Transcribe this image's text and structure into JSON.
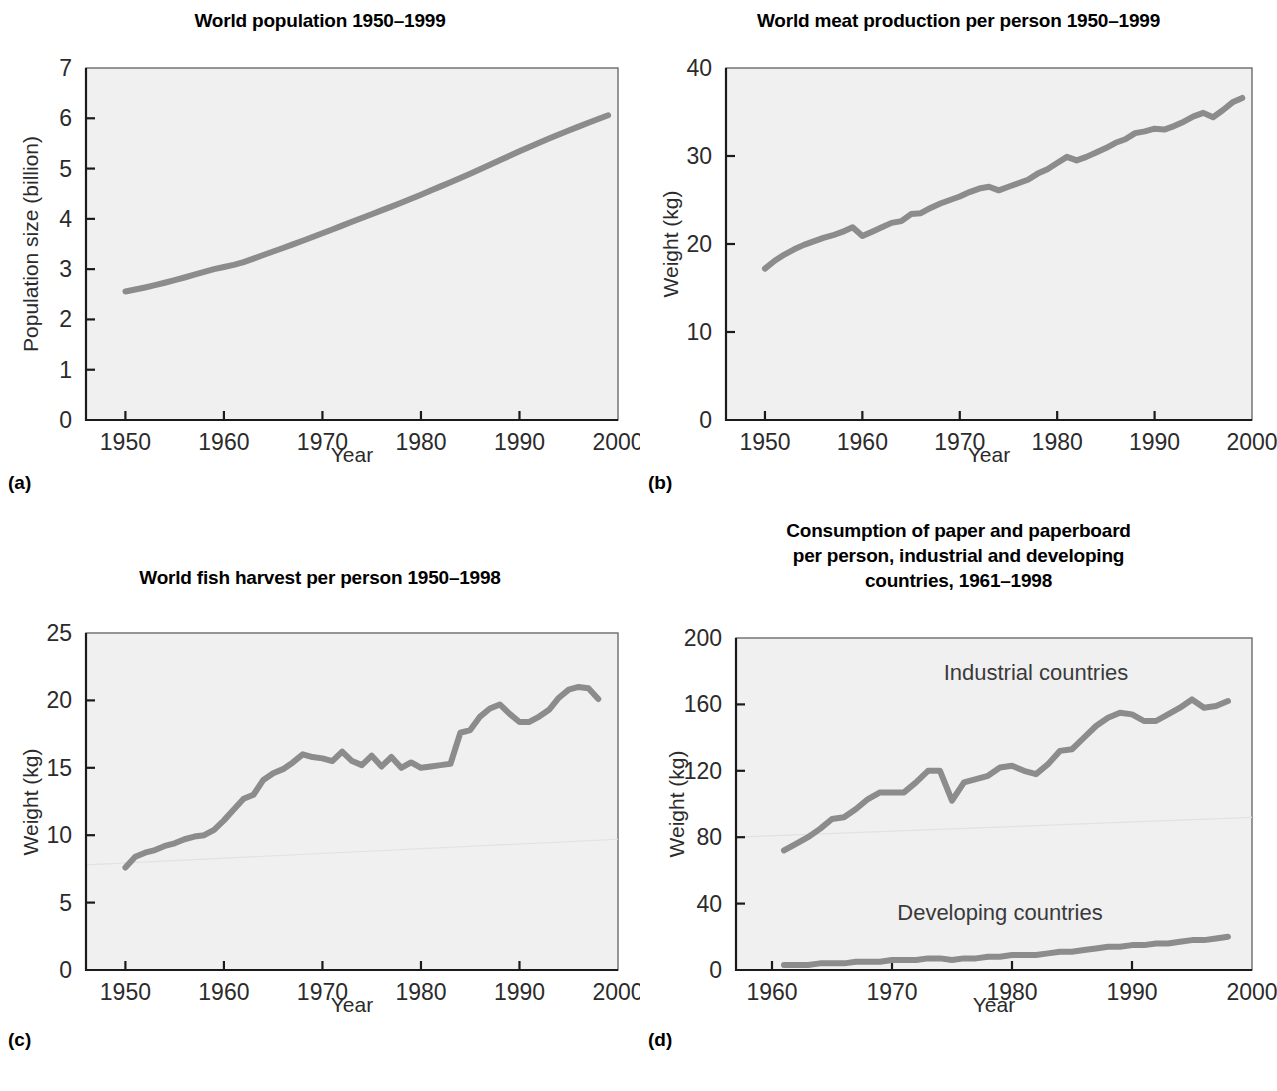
{
  "figure": {
    "background": "#ffffff",
    "line_color": "#8c8c8c",
    "plot_background": "#f0f0f0"
  },
  "panels": [
    {
      "letter": "(a)",
      "title": "World population 1950–1999",
      "xlabel": "Year",
      "ylabel": "Population size (billion)"
    },
    {
      "letter": "(b)",
      "title": "World meat production per person 1950–1999",
      "xlabel": "Year",
      "ylabel": "Weight (kg)"
    },
    {
      "letter": "(c)",
      "title": "World fish harvest per person 1950–1998",
      "xlabel": "Year",
      "ylabel": "Weight (kg)"
    },
    {
      "letter": "(d)",
      "title_lines": [
        "Consumption of paper and paperboard",
        "per person, industrial and developing",
        "countries, 1961–1998"
      ],
      "xlabel": "Year",
      "ylabel": "Weight (kg)",
      "annotations": [
        "Industrial countries",
        "Developing countries"
      ]
    }
  ],
  "chart_data": [
    {
      "id": "a",
      "type": "line",
      "title": "World population 1950–1999",
      "xlabel": "Year",
      "ylabel": "Population size (billion)",
      "xlim": [
        1946,
        2000
      ],
      "ylim": [
        0,
        7
      ],
      "xticks": [
        1950,
        1960,
        1970,
        1980,
        1990,
        2000
      ],
      "yticks": [
        0,
        1,
        2,
        3,
        4,
        5,
        6,
        7
      ],
      "grid": false,
      "legend": "none",
      "x": [
        1950,
        1951,
        1952,
        1953,
        1954,
        1955,
        1956,
        1957,
        1958,
        1959,
        1960,
        1961,
        1962,
        1963,
        1964,
        1965,
        1966,
        1967,
        1968,
        1969,
        1970,
        1971,
        1972,
        1973,
        1974,
        1975,
        1976,
        1977,
        1978,
        1979,
        1980,
        1981,
        1982,
        1983,
        1984,
        1985,
        1986,
        1987,
        1988,
        1989,
        1990,
        1991,
        1992,
        1993,
        1994,
        1995,
        1996,
        1997,
        1998,
        1999
      ],
      "series": [
        {
          "name": "World population",
          "values": [
            2.556,
            2.594,
            2.636,
            2.682,
            2.73,
            2.781,
            2.834,
            2.89,
            2.947,
            3.001,
            3.043,
            3.084,
            3.141,
            3.21,
            3.281,
            3.351,
            3.421,
            3.492,
            3.564,
            3.638,
            3.713,
            3.79,
            3.866,
            3.942,
            4.018,
            4.093,
            4.168,
            4.244,
            4.321,
            4.4,
            4.48,
            4.562,
            4.646,
            4.73,
            4.814,
            4.898,
            4.985,
            5.075,
            5.165,
            5.255,
            5.344,
            5.43,
            5.514,
            5.596,
            5.677,
            5.756,
            5.834,
            5.911,
            5.987,
            6.06
          ]
        }
      ]
    },
    {
      "id": "b",
      "type": "line",
      "title": "World meat production per person 1950–1999",
      "xlabel": "Year",
      "ylabel": "Weight (kg)",
      "xlim": [
        1946,
        2000
      ],
      "ylim": [
        0,
        40
      ],
      "xticks": [
        1950,
        1960,
        1970,
        1980,
        1990,
        2000
      ],
      "yticks": [
        0,
        10,
        20,
        30,
        40
      ],
      "grid": false,
      "legend": "none",
      "x": [
        1950,
        1951,
        1952,
        1953,
        1954,
        1955,
        1956,
        1957,
        1958,
        1959,
        1960,
        1961,
        1962,
        1963,
        1964,
        1965,
        1966,
        1967,
        1968,
        1969,
        1970,
        1971,
        1972,
        1973,
        1974,
        1975,
        1976,
        1977,
        1978,
        1979,
        1980,
        1981,
        1982,
        1983,
        1984,
        1985,
        1986,
        1987,
        1988,
        1989,
        1990,
        1991,
        1992,
        1993,
        1994,
        1995,
        1996,
        1997,
        1998,
        1999
      ],
      "series": [
        {
          "name": "Meat production per person",
          "values": [
            17.2,
            18.1,
            18.8,
            19.4,
            19.9,
            20.3,
            20.7,
            21.0,
            21.4,
            21.9,
            20.9,
            21.4,
            21.9,
            22.4,
            22.6,
            23.4,
            23.5,
            24.1,
            24.6,
            25.0,
            25.4,
            25.9,
            26.3,
            26.5,
            26.1,
            26.5,
            26.9,
            27.3,
            28.0,
            28.5,
            29.2,
            29.9,
            29.5,
            29.9,
            30.4,
            30.9,
            31.5,
            31.9,
            32.6,
            32.8,
            33.1,
            33.0,
            33.4,
            33.9,
            34.5,
            34.9,
            34.4,
            35.2,
            36.1,
            36.6
          ]
        }
      ]
    },
    {
      "id": "c",
      "type": "line",
      "title": "World fish harvest per person 1950–1998",
      "xlabel": "Year",
      "ylabel": "Weight (kg)",
      "xlim": [
        1946,
        2000
      ],
      "ylim": [
        0,
        25
      ],
      "xticks": [
        1950,
        1960,
        1970,
        1980,
        1990,
        2000
      ],
      "yticks": [
        0,
        5,
        10,
        15,
        20,
        25
      ],
      "grid": false,
      "legend": "none",
      "x": [
        1950,
        1951,
        1952,
        1953,
        1954,
        1955,
        1956,
        1957,
        1958,
        1959,
        1960,
        1961,
        1962,
        1963,
        1964,
        1965,
        1966,
        1967,
        1968,
        1969,
        1970,
        1971,
        1972,
        1973,
        1974,
        1975,
        1976,
        1977,
        1978,
        1979,
        1980,
        1981,
        1982,
        1983,
        1984,
        1985,
        1986,
        1987,
        1988,
        1989,
        1990,
        1991,
        1992,
        1993,
        1994,
        1995,
        1996,
        1997,
        1998
      ],
      "series": [
        {
          "name": "Fish harvest per person",
          "values": [
            7.6,
            8.4,
            8.7,
            8.9,
            9.2,
            9.4,
            9.7,
            9.9,
            10.0,
            10.4,
            11.1,
            11.9,
            12.7,
            13.0,
            14.1,
            14.6,
            14.9,
            15.4,
            16.0,
            15.8,
            15.7,
            15.5,
            16.2,
            15.5,
            15.2,
            15.9,
            15.1,
            15.8,
            15.0,
            15.4,
            15.0,
            15.1,
            15.2,
            15.3,
            17.6,
            17.8,
            18.8,
            19.4,
            19.7,
            19.0,
            18.4,
            18.4,
            18.8,
            19.3,
            20.2,
            20.8,
            21.0,
            20.9,
            20.1
          ]
        }
      ]
    },
    {
      "id": "d",
      "type": "line",
      "title": "Consumption of paper and paperboard per person, industrial and developing countries, 1961–1998",
      "xlabel": "Year",
      "ylabel": "Weight (kg)",
      "xlim": [
        1957,
        2000
      ],
      "ylim": [
        0,
        200
      ],
      "xticks": [
        1960,
        1970,
        1980,
        1990,
        2000
      ],
      "yticks": [
        0,
        40,
        80,
        120,
        160,
        200
      ],
      "grid": false,
      "legend": "inline-annotations",
      "x": [
        1961,
        1962,
        1963,
        1964,
        1965,
        1966,
        1967,
        1968,
        1969,
        1970,
        1971,
        1972,
        1973,
        1974,
        1975,
        1976,
        1977,
        1978,
        1979,
        1980,
        1981,
        1982,
        1983,
        1984,
        1985,
        1986,
        1987,
        1988,
        1989,
        1990,
        1991,
        1992,
        1993,
        1994,
        1995,
        1996,
        1997,
        1998
      ],
      "series": [
        {
          "name": "Industrial countries",
          "values": [
            72,
            76,
            80,
            85,
            91,
            92,
            97,
            103,
            107,
            107,
            107,
            113,
            120,
            120,
            102,
            113,
            115,
            117,
            122,
            123,
            120,
            118,
            124,
            132,
            133,
            140,
            147,
            152,
            155,
            154,
            150,
            150,
            154,
            158,
            163,
            158,
            159,
            162
          ]
        },
        {
          "name": "Developing countries",
          "values": [
            3,
            3,
            3,
            4,
            4,
            4,
            5,
            5,
            5,
            6,
            6,
            6,
            7,
            7,
            6,
            7,
            7,
            8,
            8,
            9,
            9,
            9,
            10,
            11,
            11,
            12,
            13,
            14,
            14,
            15,
            15,
            16,
            16,
            17,
            18,
            18,
            19,
            20
          ]
        }
      ],
      "annotations": [
        {
          "text": "Industrial countries",
          "x": 1982,
          "y": 175
        },
        {
          "text": "Developing countries",
          "x": 1979,
          "y": 30
        }
      ]
    }
  ]
}
